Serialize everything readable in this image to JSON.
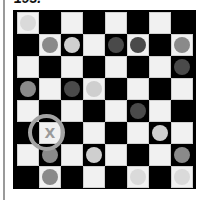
{
  "header": {
    "puzzle_number": "193."
  },
  "board": {
    "size": 8,
    "colors": {
      "light_square": "#f1f1f1",
      "dark_square": "#000000",
      "ring": "#a3a3a3",
      "marker": "#9a9a9a"
    },
    "piece_colors": {
      "faint": "#dadada",
      "light": "#cfcfcf",
      "medium": "#8a8a8a",
      "dark": "#4a4a4a"
    },
    "pieces": [
      {
        "row": 0,
        "col": 0,
        "shade": "faint"
      },
      {
        "row": 1,
        "col": 1,
        "shade": "medium"
      },
      {
        "row": 1,
        "col": 2,
        "shade": "light"
      },
      {
        "row": 1,
        "col": 4,
        "shade": "dark"
      },
      {
        "row": 1,
        "col": 5,
        "shade": "dark"
      },
      {
        "row": 1,
        "col": 7,
        "shade": "medium"
      },
      {
        "row": 2,
        "col": 7,
        "shade": "dark"
      },
      {
        "row": 3,
        "col": 0,
        "shade": "medium"
      },
      {
        "row": 3,
        "col": 2,
        "shade": "dark"
      },
      {
        "row": 3,
        "col": 3,
        "shade": "light"
      },
      {
        "row": 4,
        "col": 5,
        "shade": "dark"
      },
      {
        "row": 5,
        "col": 6,
        "shade": "light"
      },
      {
        "row": 6,
        "col": 1,
        "shade": "medium"
      },
      {
        "row": 6,
        "col": 3,
        "shade": "light"
      },
      {
        "row": 6,
        "col": 7,
        "shade": "medium"
      },
      {
        "row": 7,
        "col": 1,
        "shade": "medium"
      },
      {
        "row": 7,
        "col": 5,
        "shade": "faint"
      },
      {
        "row": 7,
        "col": 7,
        "shade": "faint"
      }
    ],
    "marker": {
      "row": 5,
      "col": 1,
      "label": "X",
      "highlighted": true
    }
  }
}
